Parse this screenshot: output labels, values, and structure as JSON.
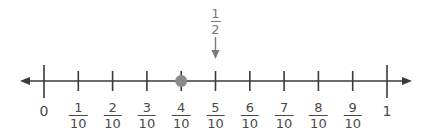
{
  "number_line": {
    "start_label": "0",
    "end_label": "1",
    "ticks": [
      {
        "value": 0,
        "label": "0",
        "numerator": null,
        "denominator": null
      },
      {
        "value": 0.1,
        "numerator": "1",
        "denominator": "10"
      },
      {
        "value": 0.2,
        "numerator": "2",
        "denominator": "10"
      },
      {
        "value": 0.3,
        "numerator": "3",
        "denominator": "10"
      },
      {
        "value": 0.4,
        "numerator": "4",
        "denominator": "10"
      },
      {
        "value": 0.5,
        "numerator": "5",
        "denominator": "10"
      },
      {
        "value": 0.6,
        "numerator": "6",
        "denominator": "10"
      },
      {
        "value": 0.7,
        "numerator": "7",
        "denominator": "10"
      },
      {
        "value": 0.8,
        "numerator": "8",
        "denominator": "10"
      },
      {
        "value": 0.9,
        "numerator": "9",
        "denominator": "10"
      },
      {
        "value": 1,
        "label": "1",
        "numerator": null,
        "denominator": null
      }
    ],
    "point": {
      "value": 0.4,
      "label": "4/10",
      "color": "#8a8a8a"
    },
    "marker": {
      "value": 0.5,
      "numerator": "1",
      "denominator": "2",
      "color": "#7a7a7a"
    },
    "line_color": "#3a3a3a"
  }
}
